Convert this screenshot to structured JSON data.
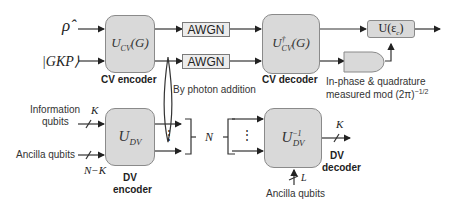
{
  "inputs": {
    "rho": "ρ̂",
    "gkp": "|GKP⟩"
  },
  "cv_encoder": {
    "operator_main": "U",
    "operator_sub": "CV",
    "operator_arg": "(G)",
    "label": "CV encoder"
  },
  "awgn": {
    "top": "AWGN",
    "bottom": "AWGN"
  },
  "cv_decoder": {
    "operator_main": "U",
    "operator_sup": "†",
    "operator_sub": "CV",
    "operator_arg": "(G)",
    "label": "CV decoder"
  },
  "correction": {
    "label_main": "U(ε",
    "label_sub": "c",
    "label_end": ")"
  },
  "measurement": {
    "line1": "In-phase & quadrature",
    "line2": "measured mod (2π)",
    "exponent": "−1/2"
  },
  "photon_addition": "By photon addition",
  "dv_encoder": {
    "operator_main": "U",
    "operator_sub": "DV",
    "label_line1": "DV",
    "label_line2": "encoder",
    "info_label_line1": "Information",
    "info_label_line2": "qubits",
    "info_count": "K",
    "ancilla_label": "Ancilla qubits",
    "ancilla_count": "N−K"
  },
  "bundle": {
    "label": "N",
    "dots": "⋮"
  },
  "dv_decoder": {
    "operator_main": "U",
    "operator_sup": "−1",
    "operator_sub": "DV",
    "label_line1": "DV",
    "label_line2": "decoder",
    "output_count": "K",
    "ancilla_label": "Ancilla qubits",
    "ancilla_count": "L"
  }
}
